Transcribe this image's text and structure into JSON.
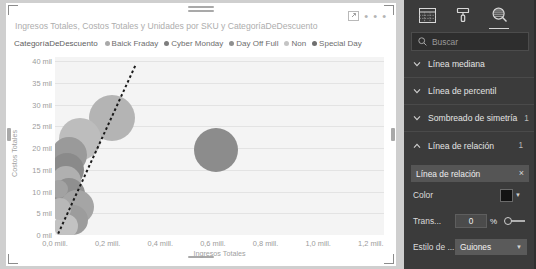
{
  "visual": {
    "title": "Ingresos Totales, Costos Totales y Unidades por SKU y CategoríaDeDescuento",
    "focus_icon": "focus-mode-icon",
    "more_label": "• • •",
    "legend_title": "CategoríaDeDescuento"
  },
  "chart_data": {
    "type": "scatter",
    "title": "Ingresos Totales, Costos Totales y Unidades por SKU y CategoríaDeDescuento",
    "xlabel": "Ingresos Totales",
    "ylabel": "Costos Totales",
    "xlim": [
      0,
      1.25
    ],
    "ylim": [
      0,
      41
    ],
    "grid": true,
    "legend_position": "top",
    "legend_title": "CategoríaDeDescuento",
    "xticks": [
      "0,0 mill.",
      "0,2 mill.",
      "0,4 mill.",
      "0,6 mill.",
      "0,8 mill.",
      "1,0 mill.",
      "1,2 mill."
    ],
    "xtick_values": [
      0,
      0.2,
      0.4,
      0.6,
      0.8,
      1.0,
      1.2
    ],
    "yticks": [
      "0 mil",
      "5 mil",
      "10 mil",
      "15 mil",
      "20 mil",
      "25 mil",
      "30 mil",
      "35 mil",
      "40 mil"
    ],
    "ytick_values": [
      0,
      5,
      10,
      15,
      20,
      25,
      30,
      35,
      40
    ],
    "series": [
      {
        "name": "Baick Fraday",
        "color": "#a9a9a9"
      },
      {
        "name": "Cyber Monday",
        "color": "#7d7d7d"
      },
      {
        "name": "Day Off Full",
        "color": "#8f8f8f"
      },
      {
        "name": "Non",
        "color": "#c4c4c4"
      },
      {
        "name": "Special Day",
        "color": "#6f6f6f"
      }
    ],
    "points": [
      {
        "series": "Non",
        "x": 0.61,
        "y": 19.5,
        "size": 44,
        "color": "#8c8c8c"
      },
      {
        "series": "Baick Fraday",
        "x": 0.215,
        "y": 27.0,
        "size": 46,
        "color": "#b4b4b4"
      },
      {
        "series": "Cyber Monday",
        "x": 0.095,
        "y": 22.0,
        "size": 42,
        "color": "#bdbdbd"
      },
      {
        "series": "Day Off Full",
        "x": 0.055,
        "y": 18.5,
        "size": 36,
        "color": "#9a9a9a"
      },
      {
        "series": "Special Day",
        "x": 0.045,
        "y": 15.0,
        "size": 34,
        "color": "#8a8a8a"
      },
      {
        "series": "Baick Fraday",
        "x": 0.04,
        "y": 12.5,
        "size": 30,
        "color": "#b0b0b0"
      },
      {
        "series": "Cyber Monday",
        "x": 0.055,
        "y": 9.5,
        "size": 32,
        "color": "#8f8f8f"
      },
      {
        "series": "Day Off Full",
        "x": 0.085,
        "y": 6.5,
        "size": 34,
        "color": "#a5a5a5"
      },
      {
        "series": "Special Day",
        "x": 0.07,
        "y": 3.5,
        "size": 30,
        "color": "#9c9c9c"
      },
      {
        "series": "Non",
        "x": 0.04,
        "y": 2.0,
        "size": 24,
        "color": "#c2c2c2"
      },
      {
        "series": "Baick Fraday",
        "x": 0.02,
        "y": 6.0,
        "size": 22,
        "color": "#b8b8b8"
      },
      {
        "series": "Cyber Monday",
        "x": 0.015,
        "y": 10.5,
        "size": 18,
        "color": "#a2a2a2"
      }
    ],
    "trendline": {
      "label": "Línea de relación",
      "style": "Guiones",
      "color": "#1a1a1a",
      "x0": 0.012,
      "y0": 0.3,
      "x1": 0.305,
      "y1": 39.0
    }
  },
  "pane": {
    "tabs": [
      {
        "id": "fields",
        "icon": "table-fields-icon",
        "active": false
      },
      {
        "id": "format",
        "icon": "paint-roller-icon",
        "active": false
      },
      {
        "id": "analytics",
        "icon": "magnifier-analytics-icon",
        "active": true
      }
    ],
    "search": {
      "placeholder": "Buscar",
      "icon": "search-icon",
      "value": ""
    },
    "sections": [
      {
        "label": "Línea mediana",
        "count": "",
        "expanded": false
      },
      {
        "label": "Línea de percentil",
        "count": "",
        "expanded": false
      },
      {
        "label": "Sombreado de simetría",
        "count": "1",
        "expanded": false
      },
      {
        "label": "Línea de relación",
        "count": "1",
        "expanded": true
      }
    ],
    "relation": {
      "field_name": "Línea de relación",
      "remove_label": "×",
      "color_label": "Color",
      "color_value": "#121212",
      "transparency_label": "Trans...",
      "transparency_value": "0",
      "transparency_unit": "%",
      "style_label": "Estilo de ...",
      "style_value": "Guiones"
    }
  }
}
